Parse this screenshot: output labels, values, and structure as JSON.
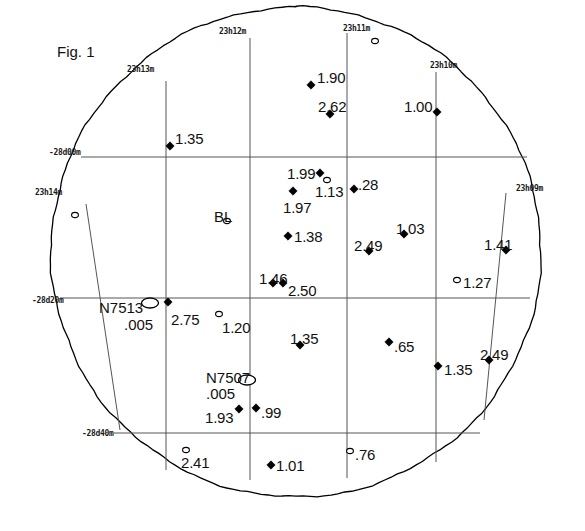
{
  "figure": {
    "caption": "Fig. 1",
    "caption_x": 57,
    "caption_y": 44
  },
  "colors": {
    "ink": "#000000",
    "grid": "#555555",
    "boundary": "#000000",
    "background": "#ffffff"
  },
  "field": {
    "center_x": 296,
    "center_y": 252,
    "radius": 245
  },
  "chart_data": {
    "type": "scatter",
    "title": "Fig. 1",
    "xlabel": "Right Ascension",
    "ylabel": "Declination",
    "grid": true,
    "legend": "none",
    "ra_ticks": [
      "23h14m",
      "23h13m",
      "23h12m",
      "23h11m",
      "23h10m",
      "23h09m"
    ],
    "dec_ticks": [
      "-28d00m",
      "-28d20m",
      "-28d40m"
    ],
    "marker_types": [
      "filled-diamond",
      "open-circle",
      "open-ellipse"
    ],
    "points": [
      {
        "label": "1.35",
        "x": 170,
        "y": 146,
        "marker": "filled-diamond",
        "lx": 175,
        "ly": 131,
        "anchor": "start"
      },
      {
        "label": "1.90",
        "x": 311,
        "y": 85,
        "marker": "filled-diamond",
        "lx": 317,
        "ly": 70,
        "anchor": "start"
      },
      {
        "label": "2.62",
        "x": 330,
        "y": 114,
        "marker": "filled-diamond",
        "lx": 318,
        "ly": 99,
        "anchor": "start"
      },
      {
        "label": "1.00",
        "x": 437,
        "y": 112,
        "marker": "filled-diamond",
        "lx": 404,
        "ly": 99,
        "anchor": "start"
      },
      {
        "label": "1.99",
        "x": 320,
        "y": 173,
        "marker": "filled-diamond",
        "lx": 287,
        "ly": 166,
        "anchor": "start"
      },
      {
        "label": "1.13",
        "x": 327,
        "y": 180,
        "marker": "open-circle",
        "lx": 315,
        "ly": 184,
        "anchor": "start"
      },
      {
        "label": "1.97",
        "x": 293,
        "y": 191,
        "marker": "filled-diamond",
        "lx": 283,
        "ly": 200,
        "anchor": "start"
      },
      {
        "label": ".28",
        "x": 354,
        "y": 189,
        "marker": "filled-diamond",
        "lx": 358,
        "ly": 177,
        "anchor": "start"
      },
      {
        "label": "1.38",
        "x": 288,
        "y": 236,
        "marker": "filled-diamond",
        "lx": 294,
        "ly": 229,
        "anchor": "start"
      },
      {
        "label": "2.49",
        "x": 369,
        "y": 251,
        "marker": "filled-diamond",
        "lx": 354,
        "ly": 238,
        "anchor": "start"
      },
      {
        "label": "1.03",
        "x": 404,
        "y": 234,
        "marker": "filled-diamond",
        "lx": 396,
        "ly": 221,
        "anchor": "start"
      },
      {
        "label": "1.41",
        "x": 506,
        "y": 250,
        "marker": "filled-diamond",
        "lx": 484,
        "ly": 237,
        "anchor": "start"
      },
      {
        "label": "1.46",
        "x": 273,
        "y": 283,
        "marker": "filled-diamond",
        "lx": 259,
        "ly": 271,
        "anchor": "start"
      },
      {
        "label": "2.50",
        "x": 283,
        "y": 283,
        "marker": "filled-diamond",
        "lx": 288,
        "ly": 283,
        "anchor": "start"
      },
      {
        "label": "1.27",
        "x": 457,
        "y": 280,
        "marker": "open-circle",
        "lx": 463,
        "ly": 275,
        "anchor": "start"
      },
      {
        "label": "2.75",
        "x": 168,
        "y": 302,
        "marker": "filled-diamond",
        "lx": 171,
        "ly": 312,
        "anchor": "start"
      },
      {
        "label": "1.20",
        "x": 219,
        "y": 314,
        "marker": "open-circle",
        "lx": 222,
        "ly": 320,
        "anchor": "start"
      },
      {
        "label": "1.35",
        "x": 300,
        "y": 345,
        "marker": "filled-diamond",
        "lx": 290,
        "ly": 331,
        "anchor": "start"
      },
      {
        "label": ".65",
        "x": 389,
        "y": 342,
        "marker": "filled-diamond",
        "lx": 394,
        "ly": 339,
        "anchor": "start"
      },
      {
        "label": "1.35",
        "x": 438,
        "y": 366,
        "marker": "filled-diamond",
        "lx": 444,
        "ly": 362,
        "anchor": "start"
      },
      {
        "label": "2.49",
        "x": 489,
        "y": 360,
        "marker": "filled-diamond",
        "lx": 480,
        "ly": 347,
        "anchor": "start"
      },
      {
        "label": "1.93",
        "x": 239,
        "y": 409,
        "marker": "filled-diamond",
        "lx": 205,
        "ly": 410,
        "anchor": "start"
      },
      {
        "label": ".99",
        "x": 256,
        "y": 408,
        "marker": "filled-diamond",
        "lx": 261,
        "ly": 405,
        "anchor": "start"
      },
      {
        "label": "2.41",
        "x": 186,
        "y": 450,
        "marker": "open-circle",
        "lx": 181,
        "ly": 455,
        "anchor": "start"
      },
      {
        "label": "1.01",
        "x": 271,
        "y": 465,
        "marker": "filled-diamond",
        "lx": 276,
        "ly": 458,
        "anchor": "start"
      },
      {
        "label": ".76",
        "x": 350,
        "y": 451,
        "marker": "open-circle",
        "lx": 355,
        "ly": 447,
        "anchor": "start"
      },
      {
        "label": "",
        "x": 375,
        "y": 41,
        "marker": "open-circle",
        "lx": 0,
        "ly": 0,
        "anchor": "start"
      },
      {
        "label": "",
        "x": 75,
        "y": 215,
        "marker": "open-circle",
        "lx": 0,
        "ly": 0,
        "anchor": "start"
      }
    ],
    "named_objects": [
      {
        "name": "BL",
        "value": "",
        "x": 227,
        "y": 221,
        "marker": "open-circle",
        "name_x": 214,
        "name_y": 209,
        "value_x": 0,
        "value_y": 0
      },
      {
        "name": "N7513",
        "value": ".005",
        "x": 150,
        "y": 303,
        "marker": "open-ellipse",
        "name_x": 99,
        "name_y": 300,
        "value_x": 124,
        "value_y": 317
      },
      {
        "name": "N7507",
        "value": ".005",
        "x": 247,
        "y": 380,
        "marker": "open-ellipse",
        "name_x": 206,
        "name_y": 370,
        "value_x": 206,
        "value_y": 386
      }
    ],
    "ra_grid_lines": [
      {
        "label": "23h14m",
        "label_x": 35,
        "label_y": 189,
        "x_top": 86,
        "y_top": 204,
        "x_bot": 120,
        "y_bot": 430
      },
      {
        "label": "23h13m",
        "label_x": 127,
        "label_y": 66,
        "x_top": 166,
        "y_top": 81,
        "x_bot": 166,
        "y_bot": 470
      },
      {
        "label": "23h12m",
        "label_x": 219,
        "label_y": 28,
        "x_top": 250,
        "y_top": 38,
        "x_bot": 250,
        "y_bot": 480
      },
      {
        "label": "23h11m",
        "label_x": 343,
        "label_y": 25,
        "x_top": 347,
        "y_top": 33,
        "x_bot": 347,
        "y_bot": 478
      },
      {
        "label": "23h10m",
        "label_x": 430,
        "label_y": 62,
        "x_top": 436,
        "y_top": 72,
        "x_bot": 436,
        "y_bot": 462
      },
      {
        "label": "23h09m",
        "label_x": 516,
        "label_y": 185,
        "x_top": 506,
        "y_top": 193,
        "x_bot": 484,
        "y_bot": 420
      }
    ],
    "dec_grid_lines": [
      {
        "label": "-28d00m",
        "label_x": 49,
        "label_y": 149,
        "x1": 81,
        "y1": 157,
        "x2": 527,
        "y2": 157
      },
      {
        "label": "-28d20m",
        "label_x": 32,
        "label_y": 297,
        "x1": 60,
        "y1": 298,
        "x2": 530,
        "y2": 298
      },
      {
        "label": "-28d40m",
        "label_x": 82,
        "label_y": 430,
        "x1": 114,
        "y1": 433,
        "x2": 480,
        "y2": 433
      }
    ]
  }
}
